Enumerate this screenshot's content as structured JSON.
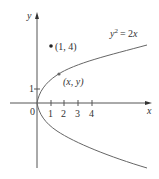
{
  "figure": {
    "curve_label": {
      "lhs": "y",
      "exp": "2",
      "rhs": "= 2",
      "var": "x"
    },
    "equation_text": "y² = 2x",
    "axes": {
      "x_label": "x",
      "y_label": "y",
      "origin_label": "0",
      "x_ticks": [
        "1",
        "2",
        "3",
        "4"
      ],
      "y_ticks": [
        "1"
      ]
    },
    "points": [
      {
        "label": "(1, 4)",
        "x": 1,
        "y": 4
      },
      {
        "label": "(x, y)",
        "on_curve": true
      }
    ],
    "colors": {
      "axis": "#555555",
      "curve": "#666666",
      "point": "#222222",
      "text": "#333333"
    }
  }
}
